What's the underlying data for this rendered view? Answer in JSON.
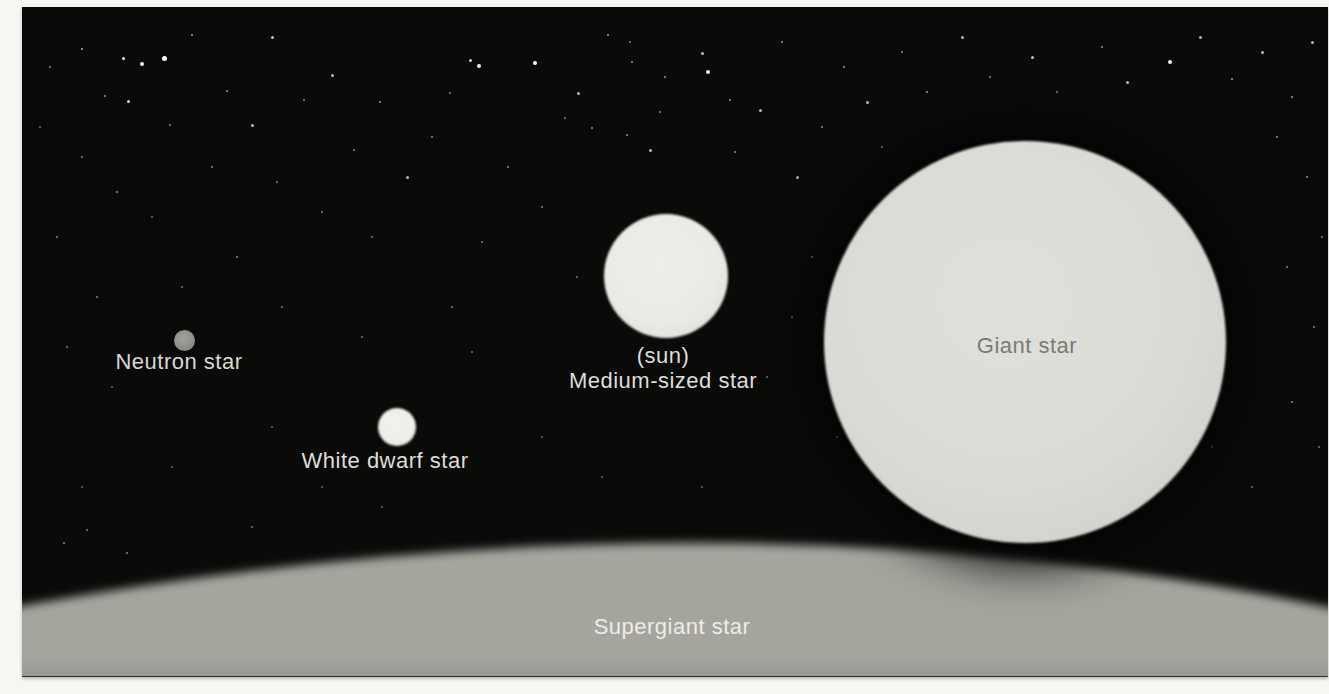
{
  "figure": {
    "space_color": "#0a0a09",
    "margin_color": "#f7f6f2",
    "background_star_color": "#ffffff"
  },
  "objects": {
    "neutron": {
      "label": "Neutron star",
      "cx": 162,
      "cy": 333,
      "r": 10.5,
      "color": "#8f8f8b",
      "label_color": "#d8d8d4",
      "label_x": 157,
      "label_y": 342
    },
    "white_dwarf": {
      "label": "White dwarf star",
      "cx": 375,
      "cy": 420,
      "r": 19,
      "color": "#efefe9",
      "label_color": "#dededa",
      "label_x": 363,
      "label_y": 441
    },
    "sun": {
      "label_line1": "(sun)",
      "label_line2": "Medium-sized star",
      "cx": 644,
      "cy": 269,
      "r": 62,
      "color": "#ebebe5",
      "label_color": "#dededa",
      "label_x": 641,
      "label_y": 336
    },
    "giant": {
      "label": "Giant star",
      "cx": 1003,
      "cy": 335,
      "r": 201,
      "color": "#dbdbd5",
      "label_color": "#7a7a76",
      "label_x": 1005,
      "label_y": 326
    },
    "supergiant": {
      "label": "Supergiant star",
      "surface_color_top": "#a6a69f",
      "surface_color_mid": "#97９792",
      "surface_color_bottom": "#8b8b86",
      "label_color": "#ececе8",
      "label_x": 650,
      "label_y": 607
    }
  },
  "starfield": [
    [
      60,
      42,
      2,
      0.7
    ],
    [
      101,
      51,
      3,
      0.9
    ],
    [
      120,
      57,
      4,
      1
    ],
    [
      142,
      51,
      5,
      1
    ],
    [
      83,
      89,
      2,
      0.6
    ],
    [
      106,
      94,
      3,
      0.85
    ],
    [
      170,
      28,
      2,
      0.6
    ],
    [
      205,
      84,
      2,
      0.6
    ],
    [
      148,
      118,
      2,
      0.55
    ],
    [
      230,
      118,
      3,
      0.7
    ],
    [
      250,
      30,
      3,
      0.75
    ],
    [
      282,
      93,
      2,
      0.6
    ],
    [
      310,
      68,
      3,
      0.7
    ],
    [
      332,
      143,
      2,
      0.55
    ],
    [
      358,
      95,
      2,
      0.6
    ],
    [
      60,
      150,
      2,
      0.5
    ],
    [
      95,
      185,
      2,
      0.55
    ],
    [
      35,
      230,
      2,
      0.5
    ],
    [
      130,
      210,
      1.5,
      0.4
    ],
    [
      190,
      160,
      2,
      0.5
    ],
    [
      255,
      175,
      1.5,
      0.45
    ],
    [
      300,
      205,
      2,
      0.5
    ],
    [
      350,
      230,
      1.5,
      0.4
    ],
    [
      215,
      250,
      2,
      0.5
    ],
    [
      160,
      280,
      1.5,
      0.4
    ],
    [
      75,
      290,
      2,
      0.5
    ],
    [
      260,
      300,
      1.5,
      0.4
    ],
    [
      385,
      170,
      3,
      0.7
    ],
    [
      410,
      130,
      2,
      0.55
    ],
    [
      28,
      60,
      1.5,
      0.5
    ],
    [
      18,
      120,
      1.5,
      0.4
    ],
    [
      448,
      53,
      3,
      0.8
    ],
    [
      457,
      59,
      4,
      0.95
    ],
    [
      513,
      56,
      4,
      1
    ],
    [
      428,
      86,
      2,
      0.5
    ],
    [
      556,
      86,
      3,
      0.7
    ],
    [
      570,
      121,
      2,
      0.55
    ],
    [
      543,
      111,
      2,
      0.5
    ],
    [
      586,
      28,
      2,
      0.6
    ],
    [
      605,
      128,
      2,
      0.55
    ],
    [
      610,
      55,
      2,
      0.6
    ],
    [
      643,
      70,
      2,
      0.6
    ],
    [
      638,
      105,
      2,
      0.5
    ],
    [
      628,
      143,
      3,
      0.7
    ],
    [
      680,
      46,
      3,
      0.7
    ],
    [
      686,
      65,
      4,
      0.9
    ],
    [
      708,
      93,
      2,
      0.6
    ],
    [
      713,
      145,
      2,
      0.55
    ],
    [
      738,
      103,
      3,
      0.7
    ],
    [
      486,
      160,
      2,
      0.55
    ],
    [
      520,
      200,
      2,
      0.5
    ],
    [
      460,
      235,
      1.5,
      0.4
    ],
    [
      430,
      300,
      2,
      0.5
    ],
    [
      555,
      270,
      1.5,
      0.4
    ],
    [
      760,
      35,
      2,
      0.6
    ],
    [
      775,
      170,
      3,
      0.65
    ],
    [
      800,
      120,
      2,
      0.55
    ],
    [
      608,
      35,
      2,
      0.5
    ],
    [
      450,
      345,
      1.5,
      0.4
    ],
    [
      340,
      330,
      1.5,
      0.4
    ],
    [
      520,
      430,
      1.5,
      0.35
    ],
    [
      580,
      470,
      1.5,
      0.35
    ],
    [
      300,
      480,
      1.5,
      0.35
    ],
    [
      360,
      500,
      1.5,
      0.35
    ],
    [
      680,
      480,
      1.5,
      0.35
    ],
    [
      230,
      520,
      1.5,
      0.4
    ],
    [
      65,
      523,
      2,
      0.5
    ],
    [
      42,
      536,
      2,
      0.5
    ],
    [
      105,
      546,
      2,
      0.5
    ],
    [
      150,
      460,
      1.5,
      0.35
    ],
    [
      60,
      480,
      1.5,
      0.35
    ],
    [
      250,
      420,
      1.5,
      0.35
    ],
    [
      90,
      380,
      1.5,
      0.35
    ],
    [
      45,
      340,
      2,
      0.45
    ],
    [
      822,
      60,
      2,
      0.6
    ],
    [
      845,
      95,
      3,
      0.7
    ],
    [
      880,
      45,
      2,
      0.55
    ],
    [
      905,
      85,
      2,
      0.6
    ],
    [
      940,
      30,
      3,
      0.7
    ],
    [
      968,
      70,
      2,
      0.55
    ],
    [
      1010,
      50,
      3,
      0.75
    ],
    [
      1035,
      85,
      2,
      0.55
    ],
    [
      1080,
      40,
      2,
      0.6
    ],
    [
      1105,
      75,
      3,
      0.7
    ],
    [
      1148,
      55,
      4,
      0.95
    ],
    [
      1178,
      30,
      3,
      0.7
    ],
    [
      1210,
      72,
      2,
      0.6
    ],
    [
      1240,
      45,
      3,
      0.7
    ],
    [
      1270,
      90,
      2,
      0.6
    ],
    [
      1290,
      35,
      3,
      0.7
    ],
    [
      1255,
      130,
      2,
      0.55
    ],
    [
      1285,
      170,
      2,
      0.55
    ],
    [
      1300,
      230,
      2,
      0.5
    ],
    [
      1265,
      260,
      1.5,
      0.45
    ],
    [
      1292,
      320,
      2,
      0.5
    ],
    [
      1270,
      395,
      2,
      0.5
    ],
    [
      1297,
      440,
      1.5,
      0.4
    ],
    [
      860,
      140,
      2,
      0.5
    ],
    [
      790,
      250,
      2,
      0.45
    ],
    [
      770,
      310,
      1.5,
      0.4
    ],
    [
      745,
      370,
      1.5,
      0.4
    ],
    [
      1230,
      480,
      1.5,
      0.4
    ],
    [
      1190,
      440,
      1.5,
      0.35
    ],
    [
      815,
      430,
      2,
      0.6
    ]
  ]
}
